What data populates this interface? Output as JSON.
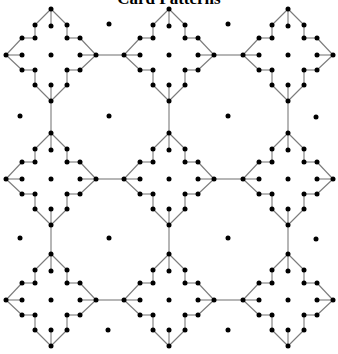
{
  "title": "Card Patterns",
  "colors": {
    "background": "#ffffff",
    "node": "#000000",
    "edge": "#7a7a7a"
  },
  "grid": {
    "columns": [
      51,
      169,
      288
    ],
    "rows": [
      55,
      179,
      300
    ]
  },
  "motif": {
    "name": "four-pointed star",
    "node_radius": 2.5,
    "nodes": [
      [
        0,
        -46
      ],
      [
        -16,
        -30
      ],
      [
        0,
        -29
      ],
      [
        16,
        -30
      ],
      [
        -29,
        -17
      ],
      [
        -16,
        -17
      ],
      [
        16,
        -17
      ],
      [
        29,
        -17
      ],
      [
        -45,
        0
      ],
      [
        -29,
        0
      ],
      [
        0,
        0
      ],
      [
        29,
        0
      ],
      [
        45,
        0
      ],
      [
        -29,
        15
      ],
      [
        -16,
        15
      ],
      [
        16,
        15
      ],
      [
        29,
        15
      ],
      [
        -16,
        30
      ],
      [
        0,
        30
      ],
      [
        16,
        30
      ],
      [
        0,
        46
      ]
    ],
    "edges": [
      [
        0,
        1
      ],
      [
        0,
        2
      ],
      [
        0,
        3
      ],
      [
        1,
        5
      ],
      [
        3,
        6
      ],
      [
        5,
        4
      ],
      [
        6,
        7
      ],
      [
        4,
        8
      ],
      [
        7,
        12
      ],
      [
        8,
        9
      ],
      [
        11,
        12
      ],
      [
        8,
        13
      ],
      [
        12,
        16
      ],
      [
        13,
        14
      ],
      [
        16,
        15
      ],
      [
        14,
        17
      ],
      [
        15,
        19
      ],
      [
        17,
        20
      ],
      [
        18,
        20
      ],
      [
        19,
        20
      ]
    ]
  },
  "links": {
    "horizontal": [
      [
        0,
        0,
        0,
        1
      ],
      [
        0,
        1,
        0,
        2
      ],
      [
        1,
        0,
        1,
        1
      ],
      [
        1,
        1,
        1,
        2
      ],
      [
        2,
        0,
        2,
        1
      ],
      [
        2,
        1,
        2,
        2
      ]
    ],
    "vertical": [
      [
        0,
        0,
        1,
        0
      ],
      [
        0,
        1,
        1,
        1
      ],
      [
        0,
        2,
        1,
        2
      ],
      [
        1,
        0,
        2,
        0
      ],
      [
        1,
        1,
        2,
        1
      ],
      [
        1,
        2,
        2,
        2
      ]
    ]
  },
  "isolated_dots": [
    [
      109,
      24
    ],
    [
      228,
      24
    ],
    [
      20,
      116
    ],
    [
      109,
      116
    ],
    [
      228,
      116
    ],
    [
      316,
      117
    ],
    [
      20,
      238
    ],
    [
      109,
      238
    ],
    [
      228,
      238
    ],
    [
      316,
      239
    ],
    [
      108,
      330
    ],
    [
      228,
      330
    ]
  ]
}
